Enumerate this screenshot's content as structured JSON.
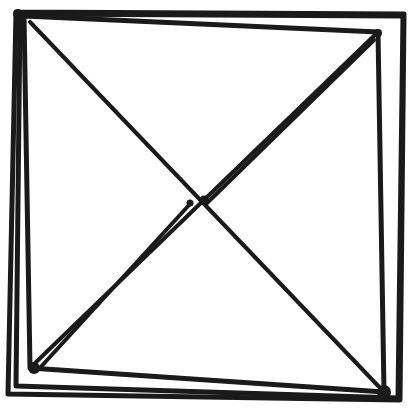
{
  "drawing": {
    "title": "Hand-drawn square with crossed diagonals",
    "background": "#ffffff",
    "ink_color": "#1a1a1a",
    "width": 409,
    "height": 416,
    "outer_frames": [
      {
        "name": "frame-outer",
        "points": [
          [
            16,
            12
          ],
          [
            404,
            14
          ],
          [
            400,
            400
          ],
          [
            8,
            394
          ],
          [
            16,
            12
          ]
        ],
        "width": 5
      },
      {
        "name": "frame-middle",
        "points": [
          [
            20,
            14
          ],
          [
            403,
            16
          ],
          [
            398,
            398
          ],
          [
            16,
            386
          ],
          [
            20,
            14
          ]
        ],
        "width": 5
      },
      {
        "name": "frame-inner",
        "points": [
          [
            24,
            16
          ],
          [
            378,
            32
          ],
          [
            384,
            392
          ],
          [
            30,
            368
          ],
          [
            24,
            16
          ]
        ],
        "width": 5
      }
    ],
    "diagonals": [
      {
        "name": "diagonal-top-left-to-bottom-right",
        "from": [
          30,
          22
        ],
        "to": [
          384,
          392
        ],
        "width": 4
      },
      {
        "name": "diagonal-bottom-left-to-top-right-a",
        "from": [
          32,
          366
        ],
        "to": [
          378,
          32
        ],
        "width": 4
      },
      {
        "name": "diagonal-bottom-left-to-top-right-b",
        "from": [
          38,
          370
        ],
        "to": [
          190,
          204
        ],
        "width": 4
      },
      {
        "name": "diagonal-bottom-left-to-top-right-c",
        "from": [
          206,
          204
        ],
        "to": [
          374,
          40
        ],
        "width": 4
      }
    ],
    "marks": [
      {
        "name": "center-dot-left",
        "cx": 190,
        "cy": 203,
        "r": 3.5
      },
      {
        "name": "center-dot-right",
        "cx": 204,
        "cy": 200,
        "r": 4.5
      },
      {
        "name": "corner-blob-bottom-left",
        "cx": 34,
        "cy": 368,
        "r": 6
      },
      {
        "name": "corner-blob-bottom-right",
        "cx": 384,
        "cy": 392,
        "r": 7
      },
      {
        "name": "corner-blob-top-right",
        "cx": 378,
        "cy": 33,
        "r": 4
      },
      {
        "name": "corner-blob-top-left",
        "cx": 18,
        "cy": 14,
        "r": 5
      }
    ]
  }
}
